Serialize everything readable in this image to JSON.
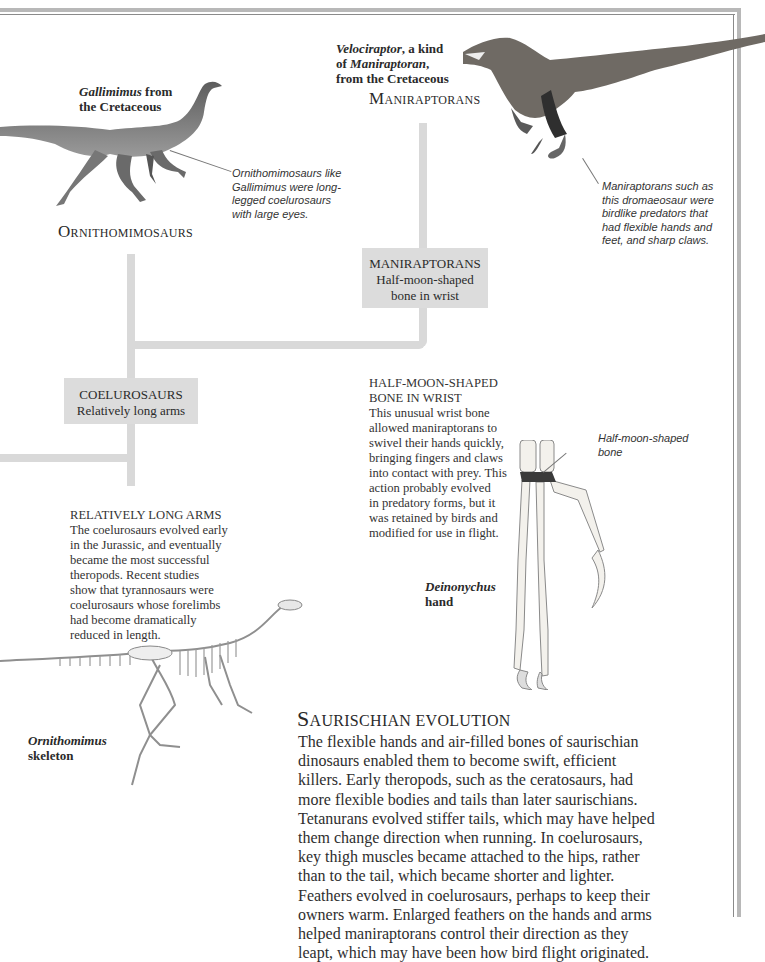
{
  "page": {
    "title": "Saurischian evolution",
    "frame_color": "#b8b8b8",
    "branch_color": "#d9d9d9",
    "box_color": "#dcdcdc"
  },
  "groups": {
    "ornithomimosaurs": {
      "heading": "Ornithomimosaurs",
      "image_caption_italic": "Gallimimus",
      "image_caption_rest": " from",
      "image_caption_line2": "the Cretaceous",
      "note_lines": [
        "Ornithomimosaurs like",
        "Gallimimus were long-",
        "legged coelurosaurs",
        "with large eyes."
      ]
    },
    "maniraptorans": {
      "heading": "Maniraptorans",
      "image_caption_italic": "Velociraptor",
      "image_caption_rest": ", a kind",
      "image_caption_line2_pre": "of ",
      "image_caption_line2_italic": "Maniraptoran",
      "image_caption_line2_post": ",",
      "image_caption_line3": "from the Cretaceous",
      "note_lines": [
        "Maniraptorans such as",
        "this dromaeosaur were",
        "birdlike predators that",
        "had flexible hands and",
        "feet, and sharp claws."
      ]
    }
  },
  "nodes": {
    "maniraptorans": {
      "title": "MANIRAPTORANS",
      "lines": [
        "Half-moon-shaped",
        "bone in wrist"
      ]
    },
    "coelurosaurs": {
      "title": "COELUROSAURS",
      "lines": [
        "Relatively long arms"
      ]
    }
  },
  "sidebars": {
    "half_moon": {
      "heading_lines": [
        "HALF-MOON-SHAPED",
        "BONE IN WRIST"
      ],
      "body_lines": [
        "This unusual wrist bone",
        "allowed maniraptorans to",
        "swivel their hands quickly,",
        "bringing fingers and claws",
        "into contact with prey. This",
        "action probably evolved",
        "in predatory forms, but it",
        "was retained by birds and",
        "modified for use in flight."
      ]
    },
    "long_arms": {
      "heading": "RELATIVELY LONG ARMS",
      "body_lines": [
        "The coelurosaurs evolved early",
        "in the Jurassic, and eventually",
        "became the most successful",
        "theropods. Recent studies",
        "show that tyrannosaurs were",
        "coelurosaurs whose forelimbs",
        "had become dramatically",
        "reduced in length."
      ]
    }
  },
  "hand": {
    "label_lines": [
      "Half-moon-shaped",
      "bone"
    ],
    "caption_italic": "Deinonychus",
    "caption_bold": "hand"
  },
  "skeleton": {
    "caption_italic": "Ornithomimus",
    "caption_bold": "skeleton"
  },
  "main": {
    "heading_first": "S",
    "heading_rest": "AURISCHIAN EVOLUTION",
    "body_lines": [
      "The flexible hands and air-filled bones of saurischian",
      "dinosaurs enabled them to become swift, efficient",
      "killers. Early theropods, such as the ceratosaurs, had",
      "more flexible bodies and tails than later saurischians.",
      "Tetanurans evolved stiffer tails, which may have helped",
      "them change direction when running. In coelurosaurs,",
      "key thigh muscles became attached to the hips, rather",
      "than to the tail, which became shorter and lighter.",
      "Feathers evolved in coelurosaurs, perhaps to keep their",
      "owners warm. Enlarged feathers on the hands and arms",
      "helped maniraptorans control their direction as they",
      "leapt, which may have been how bird flight originated."
    ]
  }
}
